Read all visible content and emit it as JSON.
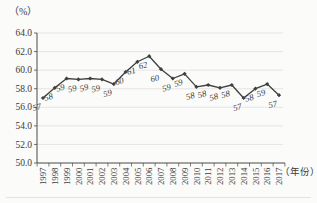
{
  "figure": {
    "y_unit_label": "（%）",
    "x_unit_label": "（年份）"
  },
  "chart_data": {
    "type": "line",
    "title": "",
    "xlabel": "（年份）",
    "ylabel": "（%）",
    "x": [
      "1997",
      "1998",
      "1999",
      "2000",
      "2001",
      "2002",
      "2003",
      "2004",
      "2005",
      "2006",
      "2007",
      "2008",
      "2009",
      "2010",
      "2011",
      "2012",
      "2013",
      "2014",
      "2015",
      "2016",
      "2017"
    ],
    "values": [
      57.0,
      58.1,
      59.1,
      59.0,
      59.1,
      59.0,
      58.5,
      59.8,
      60.9,
      61.5,
      60.1,
      59.1,
      59.6,
      58.2,
      58.4,
      58.1,
      58.4,
      57.0,
      58.0,
      58.5,
      57.3
    ],
    "point_labels": [
      "57",
      "58",
      "59",
      "59",
      "59",
      "59",
      "59",
      "60",
      "61",
      "62",
      "60",
      "59",
      "59",
      "58",
      "58",
      "58",
      "58",
      "57",
      "58",
      "59",
      "57"
    ],
    "yticks": [
      "64.0",
      "62.0",
      "60.0",
      "58.0",
      "56.0",
      "54.0",
      "52.0",
      "50.0"
    ],
    "ylim": [
      50.0,
      64.0
    ],
    "ytick_step": 2.0,
    "grid": true,
    "legend_position": "none",
    "colors": {
      "line": "#3f3f3f",
      "marker": "#3f3f3f",
      "text": "#3a3a3a",
      "grid": "#e0e0e0",
      "axis": "#4a4a4a",
      "rule": "#e3e3e1",
      "background": "#fbfbfa"
    }
  }
}
